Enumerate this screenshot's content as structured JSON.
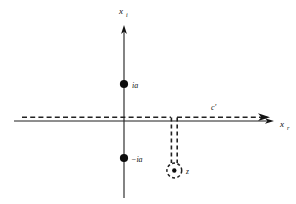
{
  "figure": {
    "background_color": "#ffffff",
    "line_color": "#1a1a1a",
    "contour_color": "#222222",
    "axes": {
      "vertical": {
        "name": "imaginary-axis",
        "label_base": "x",
        "label_subscript": "i"
      },
      "horizontal": {
        "name": "real-axis",
        "label_base": "x",
        "label_subscript": "r"
      }
    },
    "branch_points": [
      {
        "id": "upper",
        "label": "ia",
        "position": "upper-imaginary-axis"
      },
      {
        "id": "lower",
        "label": "−ia",
        "position": "lower-imaginary-axis"
      }
    ],
    "contour": {
      "name": "c-prime",
      "label": "c′",
      "style": "dashed",
      "direction": "rightward"
    },
    "pole": {
      "label": "z",
      "marker": "dot-in-dashed-circle"
    }
  }
}
